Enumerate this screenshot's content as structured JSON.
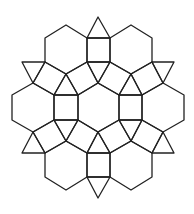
{
  "diagram": {
    "background": "#ffffff",
    "stroke": "#222222",
    "stroke_width": 1.3,
    "hexagons": [
      {
        "id": "hex-center",
        "points": [
          [
            98,
            83
          ],
          [
            119,
            95
          ],
          [
            119,
            120
          ],
          [
            98,
            132
          ],
          [
            78,
            120
          ],
          [
            78,
            95
          ]
        ]
      },
      {
        "id": "hex-upper-left",
        "points": [
          [
            66,
            25
          ],
          [
            87,
            38
          ],
          [
            87,
            62
          ],
          [
            66,
            74
          ],
          [
            45,
            62
          ],
          [
            45,
            38
          ]
        ]
      },
      {
        "id": "hex-upper-right",
        "points": [
          [
            131,
            25
          ],
          [
            152,
            38
          ],
          [
            152,
            62
          ],
          [
            131,
            74
          ],
          [
            110,
            62
          ],
          [
            110,
            38
          ]
        ]
      },
      {
        "id": "hex-left",
        "points": [
          [
            33,
            83
          ],
          [
            54,
            95
          ],
          [
            54,
            120
          ],
          [
            33,
            132
          ],
          [
            12,
            120
          ],
          [
            12,
            95
          ]
        ]
      },
      {
        "id": "hex-right",
        "points": [
          [
            163,
            83
          ],
          [
            184,
            95
          ],
          [
            184,
            120
          ],
          [
            163,
            132
          ],
          [
            142,
            120
          ],
          [
            142,
            95
          ]
        ]
      },
      {
        "id": "hex-lower-left",
        "points": [
          [
            66,
            141
          ],
          [
            87,
            153
          ],
          [
            87,
            177
          ],
          [
            66,
            190
          ],
          [
            45,
            177
          ],
          [
            45,
            153
          ]
        ]
      },
      {
        "id": "hex-lower-right",
        "points": [
          [
            131,
            141
          ],
          [
            152,
            153
          ],
          [
            152,
            177
          ],
          [
            131,
            190
          ],
          [
            110,
            177
          ],
          [
            110,
            153
          ]
        ]
      }
    ],
    "squares": [
      {
        "id": "sq-top",
        "points": [
          [
            87,
            38
          ],
          [
            110,
            38
          ],
          [
            110,
            62
          ],
          [
            87,
            62
          ]
        ]
      },
      {
        "id": "sq-bottom",
        "points": [
          [
            87,
            153
          ],
          [
            110,
            153
          ],
          [
            110,
            177
          ],
          [
            87,
            177
          ]
        ]
      },
      {
        "id": "sq-left",
        "points": [
          [
            54,
            95
          ],
          [
            78,
            95
          ],
          [
            78,
            120
          ],
          [
            54,
            120
          ]
        ]
      },
      {
        "id": "sq-right",
        "points": [
          [
            119,
            95
          ],
          [
            142,
            95
          ],
          [
            142,
            120
          ],
          [
            119,
            120
          ]
        ]
      },
      {
        "id": "sq-upper-left-diag",
        "points": [
          [
            66,
            74
          ],
          [
            87,
            62
          ],
          [
            98,
            83
          ],
          [
            78,
            95
          ]
        ]
      },
      {
        "id": "sq-upper-right-diag",
        "points": [
          [
            131,
            74
          ],
          [
            110,
            62
          ],
          [
            98,
            83
          ],
          [
            119,
            95
          ]
        ]
      },
      {
        "id": "sq-lower-left-diag",
        "points": [
          [
            66,
            141
          ],
          [
            87,
            153
          ],
          [
            98,
            132
          ],
          [
            78,
            120
          ]
        ]
      },
      {
        "id": "sq-lower-right-diag",
        "points": [
          [
            131,
            141
          ],
          [
            110,
            153
          ],
          [
            98,
            132
          ],
          [
            119,
            120
          ]
        ]
      },
      {
        "id": "sq-far-upper-left",
        "points": [
          [
            45,
            62
          ],
          [
            66,
            74
          ],
          [
            54,
            95
          ],
          [
            33,
            83
          ]
        ]
      },
      {
        "id": "sq-far-upper-right",
        "points": [
          [
            152,
            62
          ],
          [
            131,
            74
          ],
          [
            142,
            95
          ],
          [
            163,
            83
          ]
        ]
      },
      {
        "id": "sq-far-lower-left",
        "points": [
          [
            45,
            153
          ],
          [
            66,
            141
          ],
          [
            54,
            120
          ],
          [
            33,
            132
          ]
        ]
      },
      {
        "id": "sq-far-lower-right",
        "points": [
          [
            152,
            153
          ],
          [
            131,
            141
          ],
          [
            142,
            120
          ],
          [
            163,
            132
          ]
        ]
      }
    ],
    "triangles": [
      {
        "id": "tri-top-outer",
        "points": [
          [
            87,
            38
          ],
          [
            110,
            38
          ],
          [
            98,
            17
          ]
        ]
      },
      {
        "id": "tri-top-inner",
        "points": [
          [
            87,
            62
          ],
          [
            110,
            62
          ],
          [
            98,
            83
          ]
        ]
      },
      {
        "id": "tri-bottom-inner",
        "points": [
          [
            87,
            153
          ],
          [
            110,
            153
          ],
          [
            98,
            132
          ]
        ]
      },
      {
        "id": "tri-bottom-outer",
        "points": [
          [
            87,
            177
          ],
          [
            110,
            177
          ],
          [
            98,
            198
          ]
        ]
      },
      {
        "id": "tri-upper-left-inner",
        "points": [
          [
            66,
            74
          ],
          [
            54,
            95
          ],
          [
            78,
            95
          ]
        ]
      },
      {
        "id": "tri-upper-right-inner",
        "points": [
          [
            131,
            74
          ],
          [
            119,
            95
          ],
          [
            142,
            95
          ]
        ]
      },
      {
        "id": "tri-lower-left-inner",
        "points": [
          [
            66,
            141
          ],
          [
            54,
            120
          ],
          [
            78,
            120
          ]
        ]
      },
      {
        "id": "tri-lower-right-inner",
        "points": [
          [
            131,
            141
          ],
          [
            119,
            120
          ],
          [
            142,
            120
          ]
        ]
      },
      {
        "id": "tri-upper-left-outer",
        "points": [
          [
            22,
            62
          ],
          [
            45,
            62
          ],
          [
            33,
            83
          ]
        ]
      },
      {
        "id": "tri-upper-right-outer",
        "points": [
          [
            152,
            62
          ],
          [
            174,
            62
          ],
          [
            163,
            83
          ]
        ]
      },
      {
        "id": "tri-lower-left-outer",
        "points": [
          [
            22,
            153
          ],
          [
            45,
            153
          ],
          [
            33,
            132
          ]
        ]
      },
      {
        "id": "tri-lower-right-outer",
        "points": [
          [
            152,
            153
          ],
          [
            174,
            153
          ],
          [
            163,
            132
          ]
        ]
      }
    ]
  }
}
